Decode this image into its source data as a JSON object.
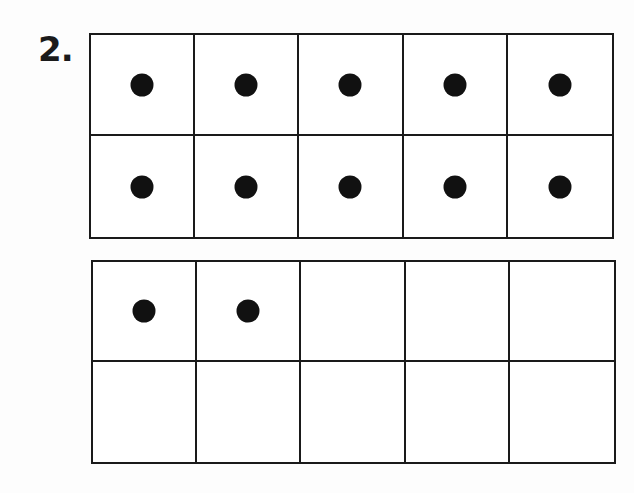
{
  "problem": {
    "number_label": "2."
  },
  "colors": {
    "line": "#1a1a1a",
    "counter": "#111111",
    "background": "#fdfdfd"
  },
  "ten_frames": [
    {
      "rows": 2,
      "columns": 5,
      "filled_count": 10,
      "cells": [
        [
          true,
          true,
          true,
          true,
          true
        ],
        [
          true,
          true,
          true,
          true,
          true
        ]
      ]
    },
    {
      "rows": 2,
      "columns": 5,
      "filled_count": 2,
      "cells": [
        [
          true,
          true,
          false,
          false,
          false
        ],
        [
          false,
          false,
          false,
          false,
          false
        ]
      ]
    }
  ],
  "total_counters": 12
}
